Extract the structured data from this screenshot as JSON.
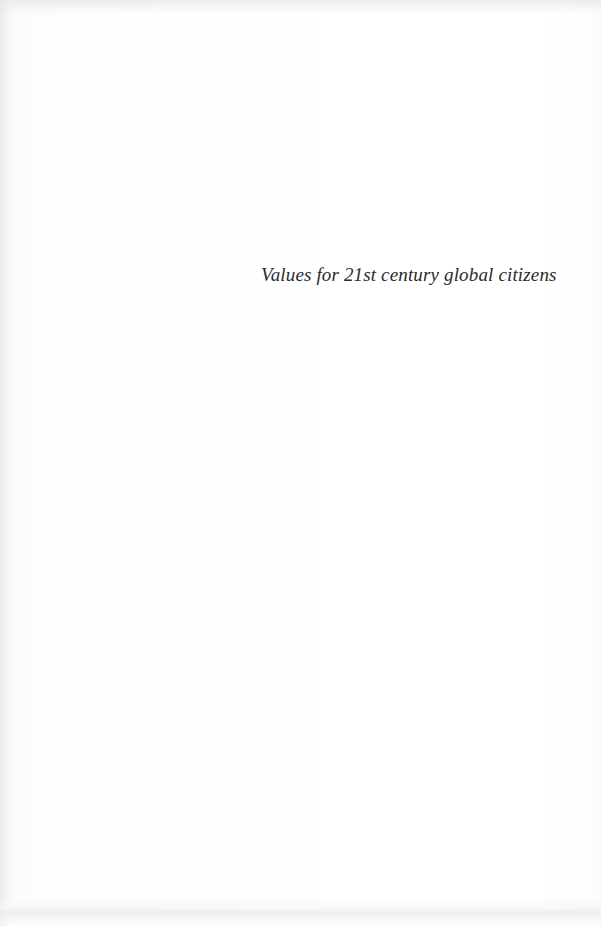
{
  "page": {
    "kind": "scanned-book-half-title-page",
    "background_color": "#fdfdfd",
    "ink_color": "#2b2a2a",
    "width": 601,
    "height": 926
  },
  "content": {
    "title": "Values for 21st century global citizens"
  },
  "artifacts": {
    "top_edge_noise": "scan-noise-band",
    "bottom_edge_shadow": "scan-shadow-band",
    "left_gutter_shading": "scan-gutter-gradient"
  }
}
